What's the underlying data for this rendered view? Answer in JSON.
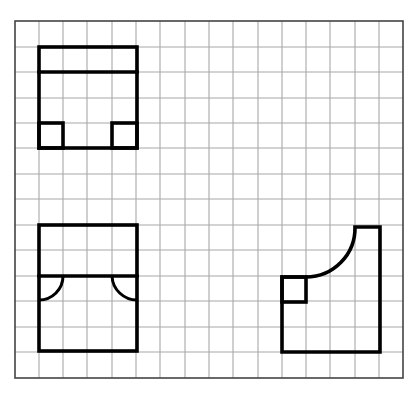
{
  "diagram": {
    "type": "orthographic-views-on-grid",
    "colors": {
      "background": "#ffffff",
      "grid": "#a8a8a8",
      "frame": "#444444",
      "outline": "#000000"
    },
    "grid": {
      "frame": {
        "x": 15,
        "y": 21,
        "width": 388,
        "height": 357
      },
      "columns_x": [
        39,
        63,
        87,
        112,
        136,
        160,
        185,
        209,
        233,
        258,
        282,
        306,
        330,
        355,
        379
      ],
      "rows_y": [
        47,
        72,
        98,
        123,
        148,
        174,
        199,
        225,
        250,
        276,
        301,
        327,
        352
      ]
    },
    "views": [
      {
        "name": "top-left-view",
        "outline": {
          "x": 39,
          "y": 47,
          "width": 98,
          "height": 101
        },
        "inner_horizontal_line_y": 72,
        "corner_squares": [
          {
            "x": 39,
            "y": 123,
            "width": 24,
            "height": 25
          },
          {
            "x": 112,
            "y": 123,
            "width": 25,
            "height": 25
          }
        ]
      },
      {
        "name": "bottom-left-view",
        "outline": {
          "x": 39,
          "y": 225,
          "width": 98,
          "height": 126
        },
        "inner_horizontal_line_y": 276,
        "quarter_arcs": [
          {
            "from": [
              63,
              276
            ],
            "to": [
              39,
              300
            ],
            "radius": 24
          },
          {
            "from": [
              112,
              276
            ],
            "to": [
              137,
              300
            ],
            "radius": 25
          }
        ]
      },
      {
        "name": "bottom-right-view",
        "path_points": [
          [
            282,
            352
          ],
          [
            282,
            277
          ],
          [
            306,
            277
          ],
          "arc r=49 to",
          [
            355,
            227
          ],
          [
            380,
            227
          ],
          [
            380,
            352
          ]
        ],
        "corner_square": {
          "x": 282,
          "y": 277,
          "width": 24,
          "height": 25
        }
      }
    ]
  }
}
